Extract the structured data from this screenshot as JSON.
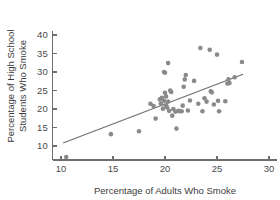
{
  "chart_data": {
    "type": "scatter",
    "title": "",
    "xlabel": "Percentage of Adults Who Smoke",
    "ylabel": "Percentage of High School Students Who Smoke",
    "ylabel_line1": "Percentage of High School",
    "ylabel_line2": "Students Who Smoke",
    "xlim": [
      9.2,
      30.8
    ],
    "ylim": [
      6.2,
      41.0
    ],
    "xticks": [
      10,
      15,
      20,
      25,
      30
    ],
    "yticks": [
      10,
      15,
      20,
      25,
      30,
      35,
      40
    ],
    "xtick_labels": [
      "10",
      "15",
      "20",
      "25",
      "30"
    ],
    "ytick_labels": [
      "10",
      "15",
      "20",
      "25",
      "30",
      "35",
      "40"
    ],
    "grid": false,
    "legend": "none",
    "marker": {
      "shape": "circle",
      "radius": 2.3,
      "color": "#8a8a8a"
    },
    "trendline": {
      "type": "linear-fit",
      "color": "#6e6e6e",
      "x_start": 10.2,
      "y_start": 10.8,
      "x_end": 27.5,
      "y_end": 29.4
    },
    "points": [
      [
        10.5,
        7.0
      ],
      [
        14.8,
        13.2
      ],
      [
        17.5,
        14.0
      ],
      [
        18.6,
        21.4
      ],
      [
        18.9,
        20.8
      ],
      [
        19.1,
        17.4
      ],
      [
        19.5,
        22.6
      ],
      [
        19.6,
        21.5
      ],
      [
        19.7,
        23.0
      ],
      [
        19.8,
        20.1
      ],
      [
        19.9,
        22.2
      ],
      [
        19.9,
        30.0
      ],
      [
        20.0,
        29.8
      ],
      [
        20.0,
        24.4
      ],
      [
        20.1,
        23.4
      ],
      [
        20.1,
        21.0
      ],
      [
        20.2,
        20.4
      ],
      [
        20.3,
        32.4
      ],
      [
        20.3,
        22.0
      ],
      [
        20.4,
        19.5
      ],
      [
        20.5,
        25.0
      ],
      [
        20.6,
        24.6
      ],
      [
        20.7,
        18.2
      ],
      [
        20.8,
        20.0
      ],
      [
        21.0,
        19.3
      ],
      [
        21.1,
        14.7
      ],
      [
        21.3,
        19.5
      ],
      [
        21.4,
        19.4
      ],
      [
        21.6,
        19.4
      ],
      [
        21.7,
        20.9
      ],
      [
        21.8,
        26.0
      ],
      [
        21.9,
        28.0
      ],
      [
        22.0,
        29.2
      ],
      [
        22.2,
        19.6
      ],
      [
        22.4,
        22.3
      ],
      [
        22.8,
        27.6
      ],
      [
        23.2,
        21.4
      ],
      [
        23.4,
        36.5
      ],
      [
        23.6,
        19.4
      ],
      [
        23.8,
        22.9
      ],
      [
        24.0,
        22.0
      ],
      [
        24.3,
        36.0
      ],
      [
        24.4,
        24.8
      ],
      [
        24.5,
        24.5
      ],
      [
        24.7,
        21.2
      ],
      [
        25.0,
        34.7
      ],
      [
        25.1,
        22.2
      ],
      [
        25.2,
        19.4
      ],
      [
        25.8,
        22.1
      ],
      [
        26.0,
        26.9
      ],
      [
        26.1,
        28.0
      ],
      [
        26.2,
        27.0
      ],
      [
        26.7,
        28.6
      ],
      [
        27.4,
        32.7
      ]
    ]
  }
}
